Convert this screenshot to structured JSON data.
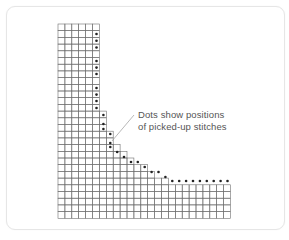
{
  "diagram": {
    "title": "",
    "annotation": {
      "line1": "Dots show positions",
      "line2": "of picked-up stitches"
    },
    "colors": {
      "grid_line": "#6f6f6f",
      "dot": "#222222",
      "text": "#555555",
      "card_border": "#e6e6e6"
    },
    "grid": {
      "origin_x": 58,
      "origin_y": 24,
      "cell_w": 6.9,
      "cell_h": 6.7,
      "columns": 25,
      "rows": 29,
      "column_top_rows": [
        0,
        0,
        0,
        0,
        0,
        0,
        13,
        16,
        18,
        19,
        20,
        21,
        21,
        22,
        23,
        23,
        24,
        24,
        24,
        24,
        24,
        24,
        24,
        24,
        24
      ]
    },
    "dots": [
      [
        96.5,
        34
      ],
      [
        96.5,
        40.8
      ],
      [
        96.5,
        47.5
      ],
      [
        96.5,
        61
      ],
      [
        96.5,
        67.6
      ],
      [
        96.5,
        74
      ],
      [
        96.5,
        88
      ],
      [
        96.5,
        94.6
      ],
      [
        96.5,
        101
      ],
      [
        96.5,
        108
      ],
      [
        103.4,
        115
      ],
      [
        103.4,
        124
      ],
      [
        103.4,
        129
      ],
      [
        110.3,
        134
      ],
      [
        110.3,
        143
      ],
      [
        110.3,
        147
      ],
      [
        117.2,
        152
      ],
      [
        124,
        157
      ],
      [
        131,
        162
      ],
      [
        137.8,
        162
      ],
      [
        144.7,
        167
      ],
      [
        151.6,
        172
      ],
      [
        158.5,
        172
      ],
      [
        165.4,
        177
      ],
      [
        172.3,
        181
      ],
      [
        179.2,
        181
      ],
      [
        186.1,
        181
      ],
      [
        193,
        181
      ],
      [
        199.9,
        181
      ],
      [
        206.8,
        181
      ],
      [
        213.7,
        181
      ],
      [
        220.6,
        181
      ],
      [
        227.5,
        181
      ]
    ],
    "leader_line": {
      "x1": 134,
      "y1": 115,
      "x2": 112,
      "y2": 141
    }
  }
}
